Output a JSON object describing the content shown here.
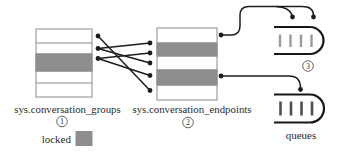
{
  "figure": {
    "left_table": {
      "name": "sys.conversation_groups",
      "step": "1",
      "row_count": 5,
      "locked_rows": [
        3
      ]
    },
    "right_table": {
      "name": "sys.conversation_endpoints",
      "step": "2",
      "row_count": 5,
      "locked_rows": [
        2,
        4
      ]
    },
    "queues": {
      "label": "queues",
      "step": "3",
      "count": 2,
      "messages_per_queue": 4
    },
    "connections": {
      "groups_to_endpoints": [
        {
          "from_row": 1,
          "to_row": 5
        },
        {
          "from_row": 2,
          "to_row": 1
        },
        {
          "from_row": 2,
          "to_row": 3
        },
        {
          "from_row": 3,
          "to_row": 2
        },
        {
          "from_row": 3,
          "to_row": 4
        }
      ],
      "endpoints_to_queues": [
        {
          "from_row": 1,
          "to_queue": 1,
          "arrowheads": 2
        },
        {
          "from_row": 4,
          "to_queue": 2,
          "arrowheads": 1
        }
      ]
    },
    "legend": {
      "label": "locked",
      "color": "#8e8e8e"
    },
    "colors": {
      "locked_fill": "#8e8e8e",
      "table_border": "#8a8a8a",
      "connector": "#1c1c1c",
      "queue_outline": "#161616",
      "queue1_bars": "#9b9b9b",
      "queue2_bars": "#4f4f4f",
      "text": "#2a2a2a"
    }
  }
}
